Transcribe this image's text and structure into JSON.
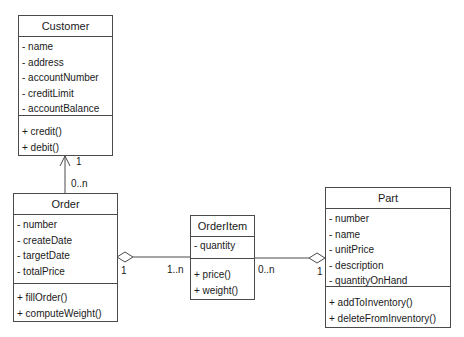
{
  "diagram": {
    "type": "UML class diagram",
    "classes": {
      "customer": {
        "name": "Customer",
        "attributes": [
          "- name",
          "- address",
          "- accountNumber",
          "- creditLimit",
          "- accountBalance"
        ],
        "operations": [
          "+ credit()",
          "+ debit()"
        ]
      },
      "order": {
        "name": "Order",
        "attributes": [
          "- number",
          "- createDate",
          "- targetDate",
          "- totalPrice"
        ],
        "operations": [
          "+ fillOrder()",
          "+ computeWeight()"
        ]
      },
      "orderitem": {
        "name": "OrderItem",
        "attributes": [
          "- quantity"
        ],
        "operations": [
          "+ price()",
          "+ weight()"
        ]
      },
      "part": {
        "name": "Part",
        "attributes": [
          "- number",
          "- name",
          "- unitPrice",
          "- description",
          "- quantityOnHand"
        ],
        "operations": [
          "+ addToInventory()",
          "+ deleteFromInventory()"
        ]
      }
    },
    "associations": {
      "customer_order": {
        "from": "Order",
        "to": "Customer",
        "kind": "navigable association",
        "mult_customer": "1",
        "mult_order": "0..n"
      },
      "order_orderitem": {
        "from": "Order",
        "to": "OrderItem",
        "kind": "aggregation",
        "mult_order": "1",
        "mult_orderitem": "1..n"
      },
      "orderitem_part": {
        "from": "OrderItem",
        "to": "Part",
        "kind": "aggregation",
        "mult_orderitem": "0..n",
        "mult_part": "1"
      }
    },
    "colors": {
      "line": "#4a4a4a",
      "text": "#1a1a1a",
      "background": "#ffffff"
    }
  }
}
